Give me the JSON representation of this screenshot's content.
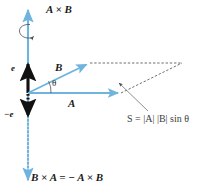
{
  "figure": {
    "title_top": "A × B",
    "unit_vector_label": "e",
    "neg_unit_vector_label": "−e",
    "vector_b_label": "B",
    "vector_a_label": "A",
    "angle_label": "θ",
    "area_formula": "S = |A| |B| sin θ",
    "bottom_label": "B × A = − A × B",
    "colors": {
      "vector_blue": "#6FB4DE",
      "axis_blue": "#6FB4DE",
      "black": "#111111",
      "dashed_gray": "#4a4a4a",
      "background": "#ffffff"
    },
    "geometry": {
      "origin": [
        28,
        93
      ],
      "vector_a_tip": [
        121,
        93
      ],
      "vector_b_tip": [
        89,
        63
      ],
      "parallelogram_far_corner": [
        182,
        63
      ],
      "axis_top": [
        28,
        8
      ],
      "axis_bottom": [
        28,
        182
      ],
      "unit_vector_tip": [
        28,
        62
      ],
      "neg_unit_vector_tip": [
        28,
        120
      ],
      "rotation_ellipse_center": [
        28,
        31
      ],
      "leader_line": [
        [
          118,
          84
        ],
        [
          148,
          110
        ]
      ]
    }
  }
}
